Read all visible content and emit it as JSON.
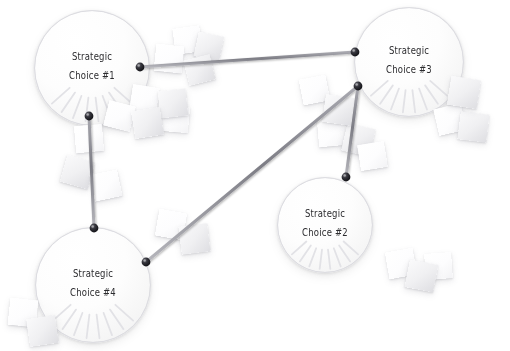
{
  "diagram": {
    "background_color": "#ffffff",
    "line_color": "#8a8a90",
    "pin_color": "#2a2a2e",
    "text_color": "#2b2b2e",
    "paper_color": "#f4f4f6"
  },
  "nodes": [
    {
      "id": "node-1",
      "label_line1": "Strategic",
      "label_line2": "Choice #1",
      "cx": 92,
      "cy": 68,
      "r": 58
    },
    {
      "id": "node-3",
      "label_line1": "Strategic",
      "label_line2": "Choice #3",
      "cx": 409,
      "cy": 62,
      "r": 55
    },
    {
      "id": "node-2",
      "label_line1": "Strategic",
      "label_line2": "Choice #2",
      "cx": 325,
      "cy": 225,
      "r": 48
    },
    {
      "id": "node-4",
      "label_line1": "Strategic",
      "label_line2": "Choice #4",
      "cx": 93,
      "cy": 285,
      "r": 58
    }
  ],
  "edges": [
    {
      "id": "edge-1-3",
      "from": "node-1",
      "to": "node-3",
      "x1": 140,
      "y1": 67,
      "x2": 355,
      "y2": 52
    },
    {
      "id": "edge-1-4",
      "from": "node-1",
      "to": "node-4",
      "x1": 89,
      "y1": 116,
      "x2": 94,
      "y2": 228
    },
    {
      "id": "edge-4-3",
      "from": "node-4",
      "to": "node-3",
      "x1": 146,
      "y1": 262,
      "x2": 358,
      "y2": 86
    },
    {
      "id": "edge-3-2",
      "from": "node-3",
      "to": "node-2",
      "x1": 358,
      "y1": 86,
      "x2": 346,
      "y2": 177
    }
  ],
  "pins": [
    {
      "id": "pin-node1-right",
      "x": 140,
      "y": 67
    },
    {
      "id": "pin-node1-bottom",
      "x": 89,
      "y": 116
    },
    {
      "id": "pin-node3-upper-left",
      "x": 355,
      "y": 52
    },
    {
      "id": "pin-node3-lower-left",
      "x": 358,
      "y": 86
    },
    {
      "id": "pin-node2-top",
      "x": 346,
      "y": 177
    },
    {
      "id": "pin-node4-top",
      "x": 94,
      "y": 228
    },
    {
      "id": "pin-node4-upper-right",
      "x": 146,
      "y": 262
    }
  ],
  "papers": [
    {
      "id": "paper-01",
      "x": 174,
      "y": 27,
      "w": 27,
      "h": 26,
      "rot": -8,
      "tone": "bright"
    },
    {
      "id": "paper-02",
      "x": 196,
      "y": 34,
      "w": 26,
      "h": 25,
      "rot": 12,
      "tone": "dim"
    },
    {
      "id": "paper-03",
      "x": 155,
      "y": 45,
      "w": 28,
      "h": 27,
      "rot": 6,
      "tone": "bright"
    },
    {
      "id": "paper-04",
      "x": 186,
      "y": 57,
      "w": 27,
      "h": 26,
      "rot": -14,
      "tone": "dim"
    },
    {
      "id": "paper-05",
      "x": 131,
      "y": 86,
      "w": 27,
      "h": 26,
      "rot": 9,
      "tone": "bright"
    },
    {
      "id": "paper-06",
      "x": 159,
      "y": 90,
      "w": 28,
      "h": 27,
      "rot": -6,
      "tone": "dim"
    },
    {
      "id": "paper-07",
      "x": 106,
      "y": 103,
      "w": 27,
      "h": 26,
      "rot": 14,
      "tone": "bright"
    },
    {
      "id": "paper-08",
      "x": 133,
      "y": 109,
      "w": 29,
      "h": 28,
      "rot": -9,
      "tone": "dim"
    },
    {
      "id": "paper-09",
      "x": 162,
      "y": 106,
      "w": 27,
      "h": 26,
      "rot": 5,
      "tone": "bright"
    },
    {
      "id": "paper-10",
      "x": 75,
      "y": 125,
      "w": 28,
      "h": 27,
      "rot": -5,
      "tone": "bright"
    },
    {
      "id": "paper-11",
      "x": 63,
      "y": 158,
      "w": 29,
      "h": 28,
      "rot": 16,
      "tone": "dim"
    },
    {
      "id": "paper-12",
      "x": 92,
      "y": 172,
      "w": 28,
      "h": 27,
      "rot": -12,
      "tone": "bright"
    },
    {
      "id": "paper-13",
      "x": 157,
      "y": 211,
      "w": 28,
      "h": 27,
      "rot": 10,
      "tone": "bright"
    },
    {
      "id": "paper-14",
      "x": 180,
      "y": 225,
      "w": 29,
      "h": 28,
      "rot": -7,
      "tone": "dim"
    },
    {
      "id": "paper-15",
      "x": 301,
      "y": 77,
      "w": 27,
      "h": 26,
      "rot": -11,
      "tone": "bright"
    },
    {
      "id": "paper-16",
      "x": 324,
      "y": 96,
      "w": 29,
      "h": 28,
      "rot": 8,
      "tone": "dim"
    },
    {
      "id": "paper-17",
      "x": 318,
      "y": 119,
      "w": 28,
      "h": 27,
      "rot": -5,
      "tone": "bright"
    },
    {
      "id": "paper-18",
      "x": 344,
      "y": 126,
      "w": 29,
      "h": 28,
      "rot": 13,
      "tone": "dim"
    },
    {
      "id": "paper-19",
      "x": 359,
      "y": 143,
      "w": 27,
      "h": 26,
      "rot": -9,
      "tone": "bright"
    },
    {
      "id": "paper-20",
      "x": 449,
      "y": 78,
      "w": 30,
      "h": 29,
      "rot": 9,
      "tone": "dim"
    },
    {
      "id": "paper-21",
      "x": 436,
      "y": 106,
      "w": 28,
      "h": 27,
      "rot": -13,
      "tone": "bright"
    },
    {
      "id": "paper-22",
      "x": 459,
      "y": 113,
      "w": 29,
      "h": 28,
      "rot": 7,
      "tone": "dim"
    },
    {
      "id": "paper-23",
      "x": 387,
      "y": 250,
      "w": 28,
      "h": 27,
      "rot": -10,
      "tone": "bright"
    },
    {
      "id": "paper-24",
      "x": 407,
      "y": 262,
      "w": 29,
      "h": 28,
      "rot": 11,
      "tone": "dim"
    },
    {
      "id": "paper-25",
      "x": 425,
      "y": 253,
      "w": 27,
      "h": 26,
      "rot": -4,
      "tone": "bright"
    },
    {
      "id": "paper-26",
      "x": 9,
      "y": 299,
      "w": 28,
      "h": 27,
      "rot": 6,
      "tone": "bright"
    },
    {
      "id": "paper-27",
      "x": 28,
      "y": 317,
      "w": 29,
      "h": 28,
      "rot": -8,
      "tone": "dim"
    }
  ]
}
